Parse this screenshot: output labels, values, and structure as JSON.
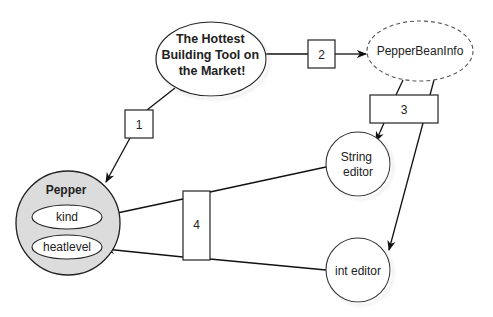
{
  "diagram": {
    "nodes": {
      "hottest": {
        "lines": [
          "The Hottest",
          "Building Tool on",
          "the Market!"
        ]
      },
      "beaninfo": {
        "label": "PepperBeanInfo"
      },
      "string_editor": {
        "lines": [
          "String",
          "editor"
        ]
      },
      "int_editor": {
        "label": "int editor"
      },
      "pepper": {
        "title": "Pepper",
        "properties": [
          "kind",
          "heatlevel"
        ]
      }
    },
    "steps": {
      "s1": "1",
      "s2": "2",
      "s3": "3",
      "s4": "4"
    }
  }
}
